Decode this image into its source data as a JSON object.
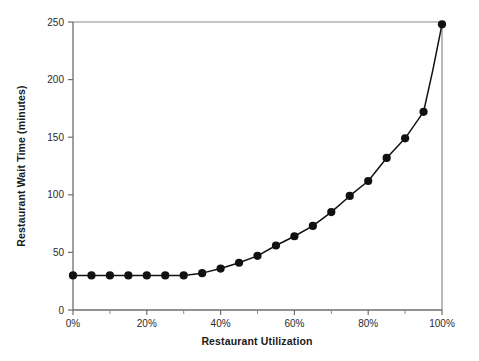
{
  "chart_data": {
    "type": "line",
    "title": "",
    "xlabel": "Restaurant Utilization",
    "ylabel": "Restaurant Wait Time (minutes)",
    "xlim": [
      0,
      100
    ],
    "ylim": [
      0,
      250
    ],
    "grid": false,
    "legend": false,
    "x_tick_labels": [
      "0%",
      "20%",
      "40%",
      "60%",
      "80%",
      "100%"
    ],
    "x_tick_values": [
      0,
      20,
      40,
      60,
      80,
      100
    ],
    "x_minor_tick_values": [
      10,
      30,
      50,
      70,
      90
    ],
    "y_tick_labels": [
      "0",
      "50",
      "100",
      "150",
      "200",
      "250"
    ],
    "y_tick_values": [
      0,
      50,
      100,
      150,
      200,
      250
    ],
    "x": [
      0,
      5,
      10,
      15,
      20,
      25,
      30,
      35,
      40,
      45,
      50,
      55,
      60,
      65,
      70,
      75,
      80,
      85,
      90,
      95,
      100
    ],
    "values": [
      30,
      30,
      30,
      30,
      30,
      30,
      30,
      32,
      36,
      41,
      47,
      56,
      64,
      73,
      85,
      99,
      112,
      132,
      149,
      172,
      208
    ],
    "series": [
      {
        "name": "Restaurant Wait Time",
        "marker": "filled-circle",
        "color": "#111111",
        "values": [
          30,
          30,
          30,
          30,
          30,
          30,
          30,
          32,
          36,
          41,
          47,
          56,
          64,
          73,
          85,
          99,
          112,
          132,
          149,
          172,
          208
        ]
      }
    ],
    "points": [
      {
        "x": 0,
        "y": 30
      },
      {
        "x": 5,
        "y": 30
      },
      {
        "x": 10,
        "y": 30
      },
      {
        "x": 15,
        "y": 30
      },
      {
        "x": 20,
        "y": 30
      },
      {
        "x": 25,
        "y": 30
      },
      {
        "x": 30,
        "y": 30
      },
      {
        "x": 35,
        "y": 32
      },
      {
        "x": 40,
        "y": 36
      },
      {
        "x": 45,
        "y": 41
      },
      {
        "x": 50,
        "y": 47
      },
      {
        "x": 55,
        "y": 56
      },
      {
        "x": 60,
        "y": 64
      },
      {
        "x": 65,
        "y": 73
      },
      {
        "x": 70,
        "y": 85
      },
      {
        "x": 75,
        "y": 99
      },
      {
        "x": 80,
        "y": 112
      },
      {
        "x": 85,
        "y": 132
      },
      {
        "x": 90,
        "y": 149
      },
      {
        "x": 95,
        "y": 172
      },
      {
        "x": 97.5,
        "y": 208
      },
      {
        "x": 100,
        "y": 248
      }
    ],
    "colors": {
      "line": "#111111",
      "marker": "#111111",
      "axis": "#6e6e6e",
      "text": "#1a1a1a",
      "background": "#ffffff"
    }
  }
}
